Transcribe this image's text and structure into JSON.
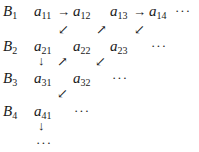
{
  "rows": [
    {
      "label": "B",
      "sub": "1"
    },
    {
      "label": "B",
      "sub": "2"
    },
    {
      "label": "B",
      "sub": "3"
    },
    {
      "label": "B",
      "sub": "4"
    }
  ],
  "entries": {
    "a11": {
      "base": "a",
      "sub": "11"
    },
    "a12": {
      "base": "a",
      "sub": "12"
    },
    "a13": {
      "base": "a",
      "sub": "13"
    },
    "a14": {
      "base": "a",
      "sub": "14"
    },
    "a21": {
      "base": "a",
      "sub": "21"
    },
    "a22": {
      "base": "a",
      "sub": "22"
    },
    "a23": {
      "base": "a",
      "sub": "23"
    },
    "a31": {
      "base": "a",
      "sub": "31"
    },
    "a32": {
      "base": "a",
      "sub": "32"
    },
    "a41": {
      "base": "a",
      "sub": "41"
    }
  },
  "arrows": {
    "right": "→",
    "down_left": "↙",
    "up_right": "↗",
    "down": "↓"
  },
  "ellipsis": "···"
}
